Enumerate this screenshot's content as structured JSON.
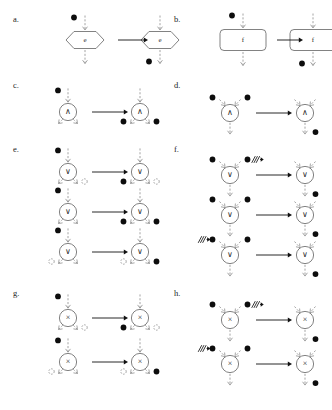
{
  "figure": {
    "background": "#ffffff",
    "width": 332,
    "height": 410,
    "colors": {
      "token_fill": "#0d0d0d",
      "empty_token_stroke": "#8a8a8a",
      "flow_arrow": "#8e8e8e",
      "transition_arrow": "#111111",
      "node_outline": "#6b6b6b",
      "text": "#1c1c1c"
    },
    "glyphs": {
      "and_gate": "∧",
      "or_gate": "∨",
      "xor_gate": "×",
      "event_label": "e",
      "task_label": "f",
      "blocked_arrow": "⇸"
    }
  },
  "panels": [
    {
      "id": "a",
      "label": "a.",
      "node_kind": "event-hexagon",
      "node_label": "e",
      "description": "Event node e: a single token on the incoming flow is consumed and produced on the outgoing flow.",
      "rows": [
        {
          "before": {
            "inputs": [
              {
                "token": "filled"
              }
            ],
            "outputs": [
              {
                "token": "none"
              }
            ]
          },
          "after": {
            "inputs": [
              {
                "token": "none"
              }
            ],
            "outputs": [
              {
                "token": "filled"
              }
            ]
          }
        }
      ]
    },
    {
      "id": "b",
      "label": "b.",
      "node_kind": "task-rounded-rect",
      "node_label": "f",
      "description": "Task node f: a single token on the incoming flow is consumed and produced on the outgoing flow.",
      "rows": [
        {
          "before": {
            "inputs": [
              {
                "token": "filled"
              }
            ],
            "outputs": [
              {
                "token": "none"
              }
            ]
          },
          "after": {
            "inputs": [
              {
                "token": "none"
              }
            ],
            "outputs": [
              {
                "token": "filled"
              }
            ]
          }
        }
      ]
    },
    {
      "id": "c",
      "label": "c.",
      "node_kind": "and-split",
      "node_label": "∧",
      "description": "AND-split: one input token produces a token on every outgoing flow.",
      "rows": [
        {
          "before": {
            "inputs": [
              {
                "token": "filled"
              }
            ],
            "outputs": [
              {
                "token": "none"
              },
              {
                "token": "none"
              }
            ]
          },
          "after": {
            "inputs": [
              {
                "token": "none"
              }
            ],
            "outputs": [
              {
                "token": "filled"
              },
              {
                "token": "filled"
              }
            ]
          }
        }
      ]
    },
    {
      "id": "d",
      "label": "d.",
      "node_kind": "and-join",
      "node_label": "∧",
      "description": "AND-join: tokens on all incoming flows are consumed and one token is produced on the outgoing flow.",
      "rows": [
        {
          "before": {
            "inputs": [
              {
                "token": "filled"
              },
              {
                "token": "filled"
              }
            ],
            "outputs": [
              {
                "token": "none"
              }
            ]
          },
          "after": {
            "inputs": [
              {
                "token": "none"
              },
              {
                "token": "none"
              }
            ],
            "outputs": [
              {
                "token": "filled"
              }
            ]
          }
        }
      ]
    },
    {
      "id": "e",
      "label": "e.",
      "node_kind": "or-split",
      "node_label": "∨",
      "description": "OR-split: one input token produces tokens on a non-empty subset of the outgoing flows.",
      "rows": [
        {
          "before": {
            "inputs": [
              {
                "token": "filled"
              }
            ],
            "outputs": [
              {
                "token": "none"
              },
              {
                "token": "empty"
              }
            ]
          },
          "after": {
            "inputs": [
              {
                "token": "none"
              }
            ],
            "outputs": [
              {
                "token": "filled"
              },
              {
                "token": "empty"
              }
            ]
          }
        },
        {
          "before": {
            "inputs": [
              {
                "token": "filled"
              }
            ],
            "outputs": [
              {
                "token": "none"
              },
              {
                "token": "none"
              }
            ]
          },
          "after": {
            "inputs": [
              {
                "token": "none"
              }
            ],
            "outputs": [
              {
                "token": "filled"
              },
              {
                "token": "filled"
              }
            ]
          }
        },
        {
          "before": {
            "inputs": [
              {
                "token": "filled"
              }
            ],
            "outputs": [
              {
                "token": "empty"
              },
              {
                "token": "none"
              }
            ]
          },
          "after": {
            "inputs": [
              {
                "token": "none"
              }
            ],
            "outputs": [
              {
                "token": "empty"
              },
              {
                "token": "filled"
              }
            ]
          }
        }
      ]
    },
    {
      "id": "f",
      "label": "f.",
      "node_kind": "or-join",
      "node_label": "∨",
      "description": "OR-join: tokens on the enabled incoming flows are consumed, blocked flows are marked, and one token is produced on the outgoing flow.",
      "rows": [
        {
          "before": {
            "inputs": [
              {
                "token": "filled"
              },
              {
                "token": "filled",
                "blocked": true
              }
            ],
            "outputs": [
              {
                "token": "none"
              }
            ]
          },
          "after": {
            "inputs": [
              {
                "token": "none"
              },
              {
                "token": "none"
              }
            ],
            "outputs": [
              {
                "token": "filled"
              }
            ]
          }
        },
        {
          "before": {
            "inputs": [
              {
                "token": "filled"
              },
              {
                "token": "filled"
              }
            ],
            "outputs": [
              {
                "token": "none"
              }
            ]
          },
          "after": {
            "inputs": [
              {
                "token": "none"
              },
              {
                "token": "none"
              }
            ],
            "outputs": [
              {
                "token": "filled"
              }
            ]
          }
        },
        {
          "before": {
            "inputs": [
              {
                "token": "filled",
                "blocked": true
              },
              {
                "token": "filled"
              }
            ],
            "outputs": [
              {
                "token": "none"
              }
            ]
          },
          "after": {
            "inputs": [
              {
                "token": "none"
              },
              {
                "token": "none"
              }
            ],
            "outputs": [
              {
                "token": "filled"
              }
            ]
          }
        }
      ]
    },
    {
      "id": "g",
      "label": "g.",
      "node_kind": "xor-split",
      "node_label": "×",
      "description": "XOR-split: one input token produces a token on exactly one of the outgoing flows.",
      "rows": [
        {
          "before": {
            "inputs": [
              {
                "token": "filled"
              }
            ],
            "outputs": [
              {
                "token": "none"
              },
              {
                "token": "empty"
              }
            ]
          },
          "after": {
            "inputs": [
              {
                "token": "none"
              }
            ],
            "outputs": [
              {
                "token": "filled"
              },
              {
                "token": "empty"
              }
            ]
          }
        },
        {
          "before": {
            "inputs": [
              {
                "token": "filled"
              }
            ],
            "outputs": [
              {
                "token": "empty"
              },
              {
                "token": "none"
              }
            ]
          },
          "after": {
            "inputs": [
              {
                "token": "none"
              }
            ],
            "outputs": [
              {
                "token": "empty"
              },
              {
                "token": "filled"
              }
            ]
          }
        }
      ]
    },
    {
      "id": "h",
      "label": "h.",
      "node_kind": "xor-join",
      "node_label": "×",
      "description": "XOR-join: a token on exactly one enabled incoming flow is consumed and one token is produced on the outgoing flow.",
      "rows": [
        {
          "before": {
            "inputs": [
              {
                "token": "filled"
              },
              {
                "token": "filled",
                "blocked": true
              }
            ],
            "outputs": [
              {
                "token": "none"
              }
            ]
          },
          "after": {
            "inputs": [
              {
                "token": "none"
              },
              {
                "token": "none"
              }
            ],
            "outputs": [
              {
                "token": "filled"
              }
            ]
          }
        },
        {
          "before": {
            "inputs": [
              {
                "token": "filled",
                "blocked": true
              },
              {
                "token": "filled"
              }
            ],
            "outputs": [
              {
                "token": "none"
              }
            ]
          },
          "after": {
            "inputs": [
              {
                "token": "none"
              },
              {
                "token": "none"
              }
            ],
            "outputs": [
              {
                "token": "filled"
              }
            ]
          }
        }
      ]
    }
  ]
}
